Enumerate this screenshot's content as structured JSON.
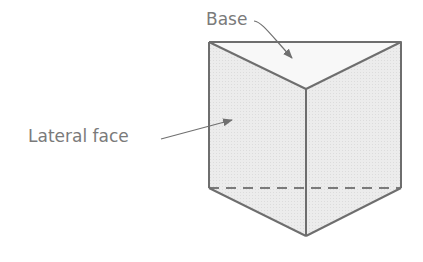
{
  "diagram": {
    "labels": {
      "base": "Base",
      "lateral_face": "Lateral face"
    },
    "colors": {
      "edge": "#6e6e6e",
      "face_fill": "#e9e9e9",
      "base_fill": "#f7f7f7",
      "text": "#7a7a7a"
    }
  }
}
